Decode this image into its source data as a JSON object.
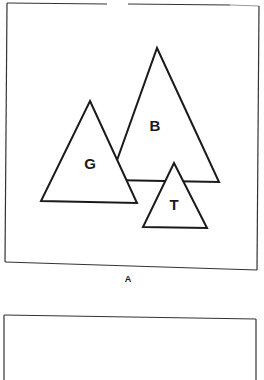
{
  "panel_a": {
    "caption": "A",
    "shapes": [
      {
        "label": "B",
        "type": "triangle"
      },
      {
        "label": "G",
        "type": "triangle"
      },
      {
        "label": "T",
        "type": "triangle"
      }
    ]
  },
  "panel_b": {
    "caption": ""
  },
  "colors": {
    "stroke": "#1a1a1a",
    "background": "#ffffff"
  }
}
